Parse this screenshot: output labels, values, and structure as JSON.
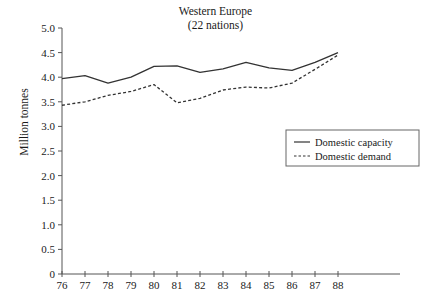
{
  "chart_data": {
    "type": "line",
    "title": "Western Europe",
    "subtitle": "(22 nations)",
    "xlabel": "",
    "ylabel": "Million tonnes",
    "x": [
      76,
      77,
      78,
      79,
      80,
      81,
      82,
      83,
      84,
      85,
      86,
      87,
      88
    ],
    "xtick_labels": [
      "76",
      "77",
      "78",
      "79",
      "80",
      "81",
      "82",
      "83",
      "84",
      "85",
      "86",
      "87",
      "88"
    ],
    "ytick_labels": [
      "0",
      "0.5",
      "1.0",
      "1.5",
      "2.0",
      "2.5",
      "3.0",
      "3.5",
      "4.0",
      "4.5",
      "5.0"
    ],
    "ytick_values": [
      0,
      0.5,
      1.0,
      1.5,
      2.0,
      2.5,
      3.0,
      3.5,
      4.0,
      4.5,
      5.0
    ],
    "xlim": [
      76,
      88
    ],
    "ylim": [
      0,
      5.0
    ],
    "grid": false,
    "legend_position": "center-right",
    "series": [
      {
        "name": "Domestic capacity",
        "style": "solid",
        "color": "#333333",
        "values": [
          3.97,
          4.03,
          3.88,
          4.0,
          4.22,
          4.23,
          4.1,
          4.17,
          4.3,
          4.19,
          4.14,
          4.3,
          4.5
        ]
      },
      {
        "name": "Domestic demand",
        "style": "dashed",
        "color": "#333333",
        "values": [
          3.43,
          3.5,
          3.63,
          3.71,
          3.85,
          3.48,
          3.57,
          3.74,
          3.8,
          3.78,
          3.88,
          4.16,
          4.45
        ]
      }
    ]
  },
  "legend": {
    "items": [
      {
        "label": "Domestic capacity",
        "style": "solid"
      },
      {
        "label": "Domestic demand",
        "style": "dashed"
      }
    ]
  },
  "colors": {
    "line": "#333333",
    "axis": "#555555",
    "text": "#1a1a1a",
    "legend_border": "#666666",
    "background": "#ffffff"
  }
}
